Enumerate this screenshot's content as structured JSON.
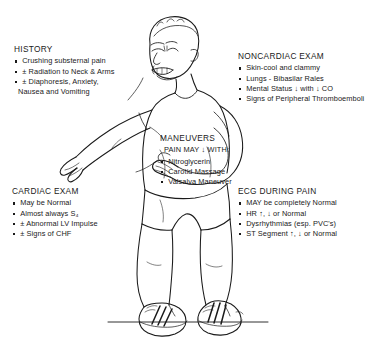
{
  "illustration": {
    "subject": "male-patient-clutching-chest",
    "description": "Line drawing of a balding man grimacing in pain, clutching his chest with both hands, wearing a t-shirt, shorts and striped athletic sneakers, standing on a ground line",
    "line_color": "#1a1a1a",
    "background_color": "#ffffff"
  },
  "callouts": {
    "history": {
      "title": "HISTORY",
      "items": [
        {
          "bullet": true,
          "text": "Crushing substernal pain"
        },
        {
          "bullet": true,
          "prefix": "±",
          "text": "Radiation to Neck & Arms"
        },
        {
          "bullet": true,
          "prefix": "±",
          "text": "Diaphoresis, Anxiety,"
        },
        {
          "bullet": false,
          "text": "Nausea and Vomiting"
        }
      ]
    },
    "noncardiac_exam": {
      "title": "NONCARDIAC EXAM",
      "items": [
        {
          "bullet": true,
          "text": "Skin-cool and clammy"
        },
        {
          "bullet": true,
          "text": "Lungs - Bibasilar Rales"
        },
        {
          "bullet": true,
          "text": "Mental Status ↓ with ↓ CO"
        },
        {
          "bullet": true,
          "text": "Signs of Peripheral Thromboemboli"
        }
      ]
    },
    "maneuvers": {
      "title": "MANEUVERS",
      "lead": "PAIN MAY ↓ WITH:",
      "items": [
        {
          "bullet": true,
          "text": "Nitroglycerin"
        },
        {
          "bullet": true,
          "text": "Carotid Massage"
        },
        {
          "bullet": true,
          "text": "Valsalva Maneuver"
        }
      ]
    },
    "cardiac_exam": {
      "title": "CARDIAC EXAM",
      "items": [
        {
          "bullet": true,
          "text": "May be Normal"
        },
        {
          "bullet": true,
          "text": "Almost always S₄"
        },
        {
          "bullet": true,
          "prefix": "±",
          "text": "Abnormal LV Impulse"
        },
        {
          "bullet": true,
          "prefix": "±",
          "text": "Signs of CHF"
        }
      ]
    },
    "ecg_during_pain": {
      "title": "ECG DURING PAIN",
      "items": [
        {
          "bullet": true,
          "text": "MAY be completely Normal"
        },
        {
          "bullet": true,
          "text": "HR ↑, ↓ or Normal"
        },
        {
          "bullet": true,
          "text": "Dysrhythmias (esp. PVC's)"
        },
        {
          "bullet": true,
          "text": "ST Segment ↑, ↓ or Normal"
        }
      ]
    }
  }
}
